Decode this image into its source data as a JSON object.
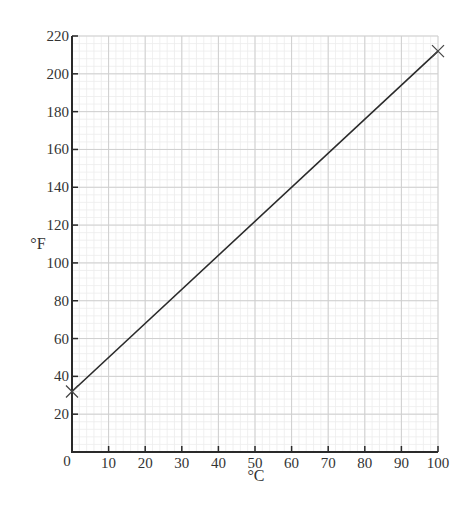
{
  "chart_data": {
    "type": "line",
    "title": "",
    "xlabel": "°C",
    "ylabel": "°F",
    "xlim": [
      0,
      100
    ],
    "ylim": [
      0,
      220
    ],
    "x_ticks": [
      10,
      20,
      30,
      40,
      50,
      60,
      70,
      80,
      90,
      100
    ],
    "y_ticks": [
      20,
      40,
      60,
      80,
      100,
      120,
      140,
      160,
      180,
      200,
      220
    ],
    "origin_label": "0",
    "grid": true,
    "minor_grid_subdivisions": 5,
    "series": [
      {
        "name": "Celsius to Fahrenheit",
        "x": [
          0,
          100
        ],
        "y": [
          32,
          212
        ],
        "marker": "x",
        "color": "#2a2a2a"
      }
    ],
    "colors": {
      "axis": "#2a2a2a",
      "major_grid": "#cfcfcf",
      "minor_grid": "#ececec",
      "line": "#2a2a2a"
    }
  }
}
